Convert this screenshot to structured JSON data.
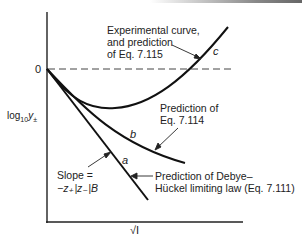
{
  "figure": {
    "type": "diagram",
    "y_axis_label": "log",
    "y_axis_sub": "10",
    "y_axis_var": "y",
    "y_axis_var_sub": "±",
    "x_axis_label": "√I",
    "zero_tick": "0",
    "curves": [
      {
        "id": "a",
        "label": "a",
        "annotation": [
          "Prediction of Debye–",
          "Hückel limiting law (Eq. 7.111)"
        ]
      },
      {
        "id": "b",
        "label": "b",
        "annotation": [
          "Prediction of",
          "Eq. 7.114"
        ]
      },
      {
        "id": "c",
        "label": "c",
        "annotation": [
          "Experimental curve,",
          "and prediction",
          "of Eq. 7.115"
        ]
      }
    ],
    "slope_label": [
      "Slope =",
      "−z₊|z₋|B"
    ]
  }
}
